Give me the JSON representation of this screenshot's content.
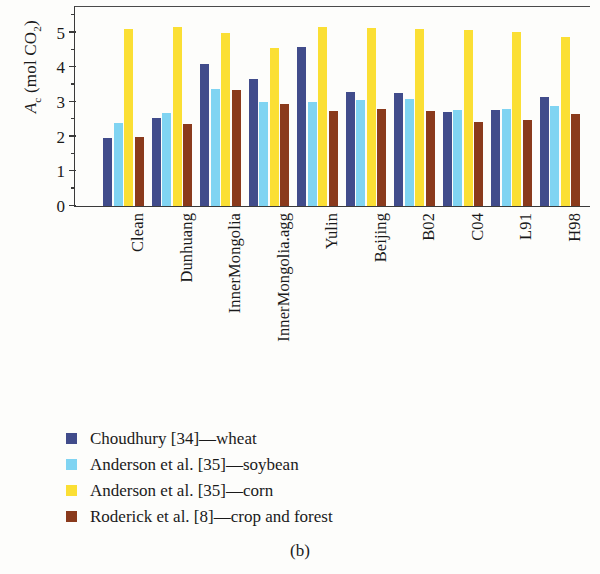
{
  "figure": {
    "caption": "(b)",
    "ylabel_prefix": "A",
    "ylabel_sub": "c",
    "ylabel_suffix": " (mol CO",
    "ylabel_sub2": "2",
    "ylabel_end": ")"
  },
  "legend": {
    "items": [
      {
        "label": "Choudhury [34]—wheat",
        "color": "#414c8b",
        "swatch_name": "legend-swatch-choudhury"
      },
      {
        "label": "Anderson et al. [35]—soybean",
        "color": "#80d4f2",
        "swatch_name": "legend-swatch-anderson-soybean"
      },
      {
        "label": "Anderson et al. [35]—corn",
        "color": "#fbdf34",
        "swatch_name": "legend-swatch-anderson-corn"
      },
      {
        "label": "Roderick et al. [8]—crop and forest",
        "color": "#8a3a1c",
        "swatch_name": "legend-swatch-roderick"
      }
    ]
  },
  "axis": {
    "y_ticks": [
      "0",
      "1",
      "2",
      "3",
      "4",
      "5"
    ],
    "y_minor_step": 0.5
  },
  "chart_data": {
    "type": "bar",
    "title": "",
    "xlabel": "",
    "ylabel": "Ac (mol CO2)",
    "ylim": [
      0,
      5.8
    ],
    "yticks": [
      0,
      1,
      2,
      3,
      4,
      5
    ],
    "grid": false,
    "legend_position": "below-plot",
    "categories": [
      "Clean",
      "Dunhuang",
      "InnerMongolia",
      "InnerMongolia.agg",
      "Yulin",
      "Beijing",
      "B02",
      "C04",
      "L91",
      "H98"
    ],
    "series": [
      {
        "name": "Choudhury [34]—wheat",
        "color": "#414c8b",
        "values": [
          1.95,
          2.55,
          4.1,
          3.67,
          4.6,
          3.3,
          3.25,
          2.7,
          2.78,
          3.15
        ]
      },
      {
        "name": "Anderson et al. [35]—soybean",
        "color": "#80d4f2",
        "values": [
          2.4,
          2.67,
          3.37,
          3.0,
          3.0,
          3.05,
          3.1,
          2.78,
          2.8,
          2.88
        ]
      },
      {
        "name": "Anderson et al. [35]—corn",
        "color": "#fbdf34",
        "values": [
          5.1,
          5.18,
          5.0,
          4.55,
          5.17,
          5.13,
          5.1,
          5.07,
          5.03,
          4.87
        ]
      },
      {
        "name": "Roderick et al. [8]—crop and forest",
        "color": "#8a3a1c",
        "values": [
          1.99,
          2.37,
          3.35,
          2.95,
          2.75,
          2.8,
          2.75,
          2.43,
          2.47,
          2.65
        ]
      }
    ]
  }
}
